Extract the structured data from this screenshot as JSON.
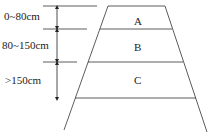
{
  "depth_labels": [
    {
      "text": "0~80cm",
      "x": 4,
      "y": 20
    },
    {
      "text": "80~150cm",
      "x": 2,
      "y": 49
    },
    {
      "text": ">150cm",
      "x": 5,
      "y": 84
    }
  ],
  "zones": [
    {
      "text": "A",
      "x": 138,
      "y": 25
    },
    {
      "text": "B",
      "x": 138,
      "y": 51
    },
    {
      "text": "C",
      "x": 138,
      "y": 84
    }
  ],
  "colors": {
    "line": "#333333",
    "text": "#222222"
  }
}
